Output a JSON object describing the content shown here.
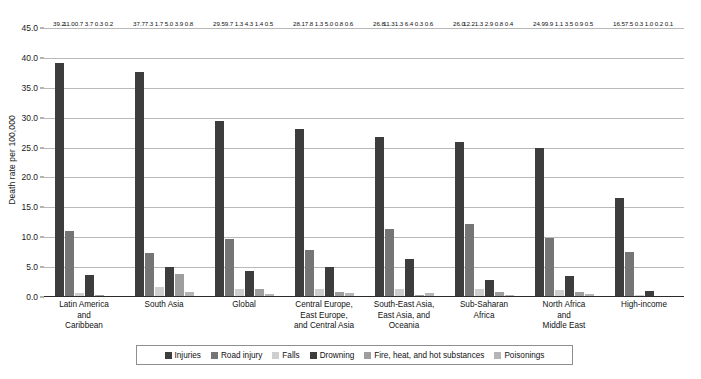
{
  "chart_data": {
    "type": "bar",
    "title": "",
    "subtitle": "",
    "xlabel": "",
    "ylabel": "Death rate per 100,000",
    "ylim": [
      0.0,
      45.0
    ],
    "ytick_step": 5.0,
    "ytick_labels": [
      "0.0",
      "5.0",
      "10.0",
      "15.0",
      "20.0",
      "25.0",
      "30.0",
      "35.0",
      "40.0",
      "45.0"
    ],
    "ytick_values": [
      0.0,
      5.0,
      10.0,
      15.0,
      20.0,
      25.0,
      30.0,
      35.0,
      40.0,
      45.0
    ],
    "grid": true,
    "grid_axis": "y",
    "legend_position": "bottom",
    "data_labels": true,
    "categories": [
      "Latin America and Caribbean",
      "South Asia",
      "Global",
      "Central Europe, East Europe, and Central Asia",
      "South-East Asia, East Asia, and Oceania",
      "Sub-Saharan Africa",
      "North Africa and Middle East",
      "High-income"
    ],
    "category_lines": [
      [
        "Latin America",
        "and",
        "Caribbean"
      ],
      [
        "South Asia"
      ],
      [
        "Global"
      ],
      [
        "Central Europe,",
        "East Europe,",
        "and Central Asia"
      ],
      [
        "South-East Asia,",
        "East Asia, and",
        "Oceania"
      ],
      [
        "Sub-Saharan",
        "Africa"
      ],
      [
        "North Africa",
        "and",
        "Middle East"
      ],
      [
        "High-income"
      ]
    ],
    "series": [
      {
        "name": "Injuries",
        "color": "#3d3d3d",
        "values": [
          39.2,
          37.7,
          29.5,
          28.1,
          26.8,
          26.0,
          24.9,
          16.5
        ],
        "labels": [
          "39.2",
          "37.7",
          "29.5",
          "28.1",
          "26.8",
          "26.0",
          "24.9",
          "16.5"
        ]
      },
      {
        "name": "Road injury",
        "color": "#757575",
        "values": [
          11.0,
          7.3,
          9.7,
          7.8,
          11.3,
          12.2,
          9.9,
          7.5
        ],
        "labels": [
          "11.0",
          "7.3",
          "9.7",
          "7.8",
          "11.3",
          "12.2",
          "9.9",
          "7.5"
        ]
      },
      {
        "name": "Falls",
        "color": "#cfcfcf",
        "values": [
          0.7,
          1.7,
          1.3,
          1.3,
          1.3,
          1.3,
          1.1,
          0.3
        ],
        "labels": [
          "0.7",
          "1.7",
          "1.3",
          "1.3",
          "1.3",
          "1.3",
          "1.1",
          "0.3"
        ]
      },
      {
        "name": "Drowning",
        "color": "#3d3d3d",
        "values": [
          3.7,
          5.0,
          4.3,
          5.0,
          6.4,
          2.9,
          3.5,
          1.0
        ],
        "labels": [
          "3.7",
          "5.0",
          "4.3",
          "5.0",
          "6.4",
          "2.9",
          "3.5",
          "1.0"
        ]
      },
      {
        "name": "Fire, heat, and hot substances",
        "color": "#9e9e9e",
        "values": [
          0.3,
          3.9,
          1.4,
          0.8,
          0.3,
          0.8,
          0.9,
          0.2
        ],
        "labels": [
          "0.3",
          "3.9",
          "1.4",
          "0.8",
          "0.3",
          "0.8",
          "0.9",
          "0.2"
        ]
      },
      {
        "name": "Poisonings",
        "color": "#b5b5b5",
        "values": [
          0.2,
          0.8,
          0.5,
          0.6,
          0.6,
          0.4,
          0.5,
          0.1
        ],
        "labels": [
          "0.2",
          "0.8",
          "0.5",
          "0.6",
          "0.6",
          "0.4",
          "0.5",
          "0.1"
        ]
      }
    ]
  }
}
